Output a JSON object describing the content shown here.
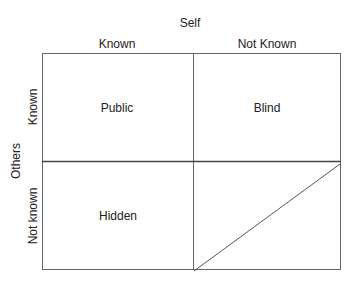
{
  "axes": {
    "top_title": "Self",
    "left_title": "Others",
    "columns": [
      "Known",
      "Not Known"
    ],
    "rows": [
      "Known",
      "Not known"
    ]
  },
  "quadrants": {
    "top_left": "Public",
    "top_right": "Blind",
    "bottom_left": "Hidden",
    "bottom_right": ""
  },
  "colors": {
    "line": "#555555",
    "text": "#222222",
    "background": "#ffffff"
  }
}
